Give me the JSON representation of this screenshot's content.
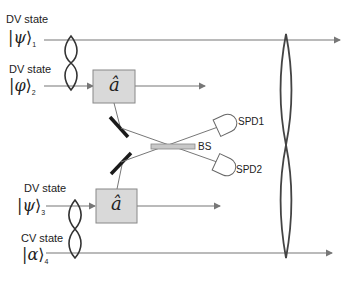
{
  "diagram": {
    "inputs": [
      {
        "label": "DV state",
        "ket_symbol": "ψ",
        "subscript": "1"
      },
      {
        "label": "DV state",
        "ket_symbol": "φ",
        "subscript": "2"
      },
      {
        "label": "DV state",
        "ket_symbol": "ψ",
        "subscript": "3"
      },
      {
        "label": "CV state",
        "ket_symbol": "α",
        "subscript": "4"
      }
    ],
    "operators": [
      {
        "symbol": "â"
      },
      {
        "symbol": "â"
      }
    ],
    "beam_splitter": {
      "label": "BS"
    },
    "detectors": [
      {
        "label": "SPD1"
      },
      {
        "label": "SPD2"
      }
    ],
    "colors": {
      "line": "#777777",
      "box_fill": "#d9d9d9",
      "box_stroke": "#888888",
      "mirror": "#1a1a1a",
      "loop": "#444444",
      "bs_fill": "#c8c8c8"
    }
  }
}
